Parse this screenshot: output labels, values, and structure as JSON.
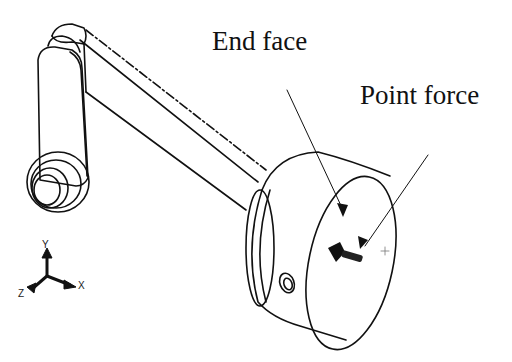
{
  "diagram": {
    "type": "mechanical-cad-isometric",
    "labels": {
      "end_face": "End face",
      "point_force": "Point force"
    },
    "triad": {
      "x": "X",
      "y": "Y",
      "z": "Z"
    },
    "colors": {
      "line": "#111111",
      "background": "#ffffff"
    }
  }
}
